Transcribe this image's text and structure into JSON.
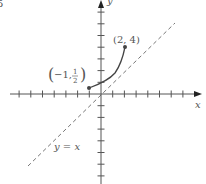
{
  "figure": {
    "corner_label": "5",
    "x_axis_label": "x",
    "y_axis_label": "y",
    "line_label": "y = x",
    "point_end": {
      "label": "(2, 4)",
      "x": 2,
      "y": 4
    },
    "point_start": {
      "label_prefix": "−1,",
      "frac_num": "1",
      "frac_den": "2",
      "x": -1,
      "y": 0.5
    },
    "colors": {
      "axis": "#555555",
      "curve": "#444444",
      "dashed": "#777777"
    }
  },
  "chart_data": {
    "type": "line",
    "title": "",
    "xlabel": "x",
    "ylabel": "y",
    "series": [
      {
        "name": "curve (2^x)",
        "points": [
          [
            -1,
            0.5
          ],
          [
            0,
            1
          ],
          [
            1,
            2
          ],
          [
            2,
            4
          ]
        ]
      },
      {
        "name": "y = x",
        "style": "dashed",
        "points": [
          [
            -6,
            -6
          ],
          [
            6,
            6
          ]
        ]
      }
    ],
    "annotations": [
      "(2, 4)",
      "(-1, 1/2)",
      "y = x"
    ],
    "xlim": [
      -8,
      8
    ],
    "ylim": [
      -7,
      8
    ]
  }
}
